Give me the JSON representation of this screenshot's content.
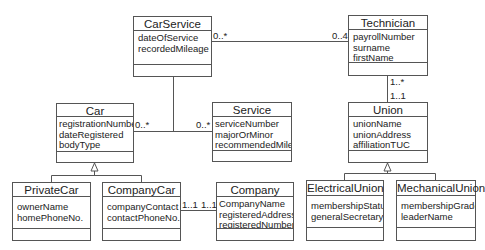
{
  "diagram": {
    "type": "UML class diagram",
    "classes": [
      {
        "id": "carservice",
        "name": "CarService",
        "attributes": [
          "dateOfService",
          "recordedMileage"
        ],
        "operations": []
      },
      {
        "id": "technician",
        "name": "Technician",
        "attributes": [
          "payrollNumber",
          "surname",
          "firstName"
        ],
        "operations": []
      },
      {
        "id": "car",
        "name": "Car",
        "attributes": [
          "registrationNumber",
          "dateRegistered",
          "bodyType"
        ],
        "operations": []
      },
      {
        "id": "service",
        "name": "Service",
        "attributes": [
          "serviceNumber",
          "majorOrMinor",
          "recommendedMiles"
        ],
        "operations": []
      },
      {
        "id": "union",
        "name": "Union",
        "attributes": [
          "unionName",
          "unionAddress",
          "affiliationTUC"
        ],
        "operations": []
      },
      {
        "id": "privatecar",
        "name": "PrivateCar",
        "attributes": [
          "ownerName",
          "homePhoneNo."
        ],
        "operations": []
      },
      {
        "id": "companycar",
        "name": "CompanyCar",
        "attributes": [
          "companyContact",
          "contactPhoneNo."
        ],
        "operations": []
      },
      {
        "id": "company",
        "name": "Company",
        "attributes": [
          "CompanyName",
          "registeredAddress",
          "registeredNumber"
        ],
        "operations": []
      },
      {
        "id": "electricalunion",
        "name": "ElectricalUnion",
        "attributes": [
          "membershipStatus",
          "generalSecretary"
        ],
        "operations": []
      },
      {
        "id": "mechanicalunion",
        "name": "MechanicalUnion",
        "attributes": [
          "membershipGrade",
          "leaderName"
        ],
        "operations": []
      }
    ],
    "multiplicities": {
      "carservice_technician_left": "0..*",
      "carservice_technician_right": "0..4",
      "technician_union_top": "1..*",
      "technician_union_bottom": "1..1",
      "car_service_left": "0..*",
      "car_service_right": "0..*",
      "companycar_company_left": "1..1",
      "companycar_company_right": "1..1"
    },
    "relationships": [
      {
        "type": "association",
        "from": "CarService",
        "to": "Technician",
        "from_mult": "0..*",
        "to_mult": "0..4"
      },
      {
        "type": "association",
        "from": "Technician",
        "to": "Union",
        "from_mult": "1..*",
        "to_mult": "1..1"
      },
      {
        "type": "association",
        "from": "Car",
        "to": "Service",
        "from_mult": "0..*",
        "to_mult": "0..*",
        "association_class": "CarService"
      },
      {
        "type": "association",
        "from": "CompanyCar",
        "to": "Company",
        "from_mult": "1..1",
        "to_mult": "1..1"
      },
      {
        "type": "generalization",
        "parent": "Car",
        "children": [
          "PrivateCar",
          "CompanyCar"
        ]
      },
      {
        "type": "generalization",
        "parent": "Union",
        "children": [
          "ElectricalUnion",
          "MechanicalUnion"
        ]
      }
    ]
  }
}
